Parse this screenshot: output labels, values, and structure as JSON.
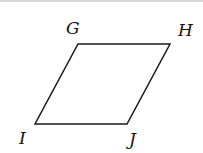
{
  "diagram": {
    "shape": "parallelogram",
    "vertices": [
      {
        "label": "G",
        "x": 78,
        "y": 44,
        "lx": 66,
        "ly": 34
      },
      {
        "label": "H",
        "x": 170,
        "y": 44,
        "lx": 178,
        "ly": 36
      },
      {
        "label": "J",
        "x": 127,
        "y": 124,
        "lx": 129,
        "ly": 145
      },
      {
        "label": "I",
        "x": 35,
        "y": 124,
        "lx": 19,
        "ly": 144
      }
    ],
    "stroke": "#1a1a1a"
  }
}
